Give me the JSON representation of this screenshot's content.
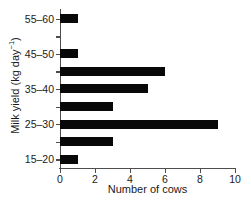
{
  "chart_data": {
    "type": "bar",
    "orientation": "horizontal",
    "title": "",
    "xlabel": "Number of cows",
    "ylabel": "Milk yield (kg day⁻¹)",
    "ylabel_base": "Milk yield (kg day",
    "ylabel_exponent": "−1",
    "ylabel_close": ")",
    "categories": [
      "15–20",
      "20–25",
      "25–30",
      "30–35",
      "35–40",
      "40–45",
      "45–50",
      "50–55",
      "55–60"
    ],
    "values": [
      1,
      3,
      9,
      3,
      5,
      6,
      1,
      0,
      1
    ],
    "xlim": [
      0,
      10
    ],
    "xticks": [
      0,
      2,
      4,
      6,
      8,
      10
    ],
    "xticklabels": [
      "0",
      "2",
      "4",
      "6",
      "8",
      "10"
    ],
    "yticklabels_shown": [
      "15–20",
      "25–30",
      "35–40",
      "45–50",
      "55–60"
    ],
    "grid": false,
    "legend": false,
    "bar_color": "#080808",
    "axis_color": "#4d4d4d",
    "text_color": "#1a1a1a",
    "background": "#ffffff"
  }
}
